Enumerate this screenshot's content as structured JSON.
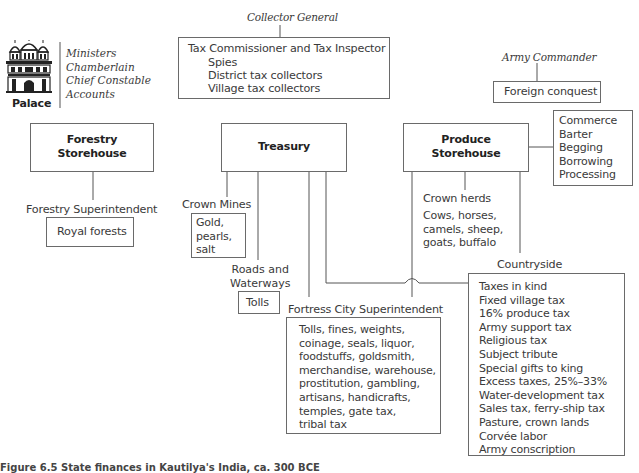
{
  "palace": {
    "label": "Palace",
    "icon": "palace-icon",
    "officials": [
      "Ministers",
      "Chamberlain",
      "Chief Constable",
      "Accounts"
    ]
  },
  "collector_general": {
    "title": "Collector General",
    "box_title": "Tax Commissioner and Tax Inspector",
    "subordinates": [
      "Spies",
      "District tax collectors",
      "Village tax collectors"
    ]
  },
  "army_commander": {
    "title": "Army Commander",
    "source": "Foreign conquest"
  },
  "forestry": {
    "storehouse": [
      "Forestry",
      "Storehouse"
    ],
    "superintendent": "Forestry Superintendent",
    "source": "Royal forests"
  },
  "treasury": {
    "title": "Treasury",
    "crown_mines": {
      "label": "Crown Mines",
      "items": [
        "Gold,",
        "pearls,",
        "salt"
      ]
    },
    "roads": {
      "label": [
        "Roads and",
        "Waterways"
      ],
      "source": "Tolls"
    },
    "fortress_city": {
      "label": "Fortress City Superintendent",
      "items": [
        "Tolls, fines, weights,",
        "coinage, seals, liquor,",
        "foodstuffs, goldsmith,",
        "merchandise, warehouse,",
        "prostitution, gambling,",
        "artisans, handicrafts,",
        "temples, gate tax,",
        "tribal tax"
      ]
    }
  },
  "produce": {
    "storehouse": [
      "Produce",
      "Storehouse"
    ],
    "other_sources": [
      "Commerce",
      "Barter",
      "Begging",
      "Borrowing",
      "Processing"
    ],
    "crown_herds": {
      "label": "Crown herds",
      "items": [
        "Cows, horses,",
        "camels, sheep,",
        "goats, buffalo"
      ]
    }
  },
  "countryside": {
    "label": "Countryside",
    "items": [
      "Taxes in kind",
      "Fixed village tax",
      "16% produce tax",
      "Army support tax",
      "Religious tax",
      "Subject tribute",
      "Special gifts to king",
      "Excess taxes, 25%–33%",
      "Water-development tax",
      "Sales tax, ferry-ship tax",
      "Pasture, crown lands",
      "Corvée labor",
      "Army conscription"
    ]
  },
  "caption": "Figure 6.5  State finances in Kautilya's India, ca. 300 BCE"
}
